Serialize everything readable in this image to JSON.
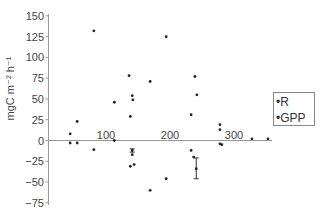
{
  "chart_data": {
    "type": "scatter",
    "title": "",
    "xlabel": "",
    "ylabel": "mgC m⁻² h⁻¹",
    "xlim": [
      0,
      380
    ],
    "ylim": [
      -75,
      150
    ],
    "x_ticks": [
      100,
      200,
      300
    ],
    "y_ticks": [
      150,
      125,
      100,
      75,
      50,
      25,
      0,
      -25,
      -50,
      -75
    ],
    "grid": false,
    "legend_position": "right",
    "legend": [
      "R",
      "GPP"
    ],
    "series": [
      {
        "name": "R",
        "points": [
          {
            "x": 44,
            "y": 8
          },
          {
            "x": 55,
            "y": 23
          },
          {
            "x": 44,
            "y": -3
          },
          {
            "x": 55,
            "y": -3
          },
          {
            "x": 81,
            "y": 132
          },
          {
            "x": 81,
            "y": -11
          },
          {
            "x": 113,
            "y": 46
          },
          {
            "x": 113,
            "y": 0
          },
          {
            "x": 136,
            "y": 78
          },
          {
            "x": 141,
            "y": 54
          },
          {
            "x": 142,
            "y": 49
          },
          {
            "x": 138,
            "y": 29
          },
          {
            "x": 169,
            "y": 71
          },
          {
            "x": 194,
            "y": 125
          },
          {
            "x": 233,
            "y": 31
          },
          {
            "x": 239,
            "y": 77
          },
          {
            "x": 242,
            "y": 55
          },
          {
            "x": 278,
            "y": 19
          },
          {
            "x": 278,
            "y": 13
          },
          {
            "x": 328,
            "y": 2
          },
          {
            "x": 353,
            "y": 2
          }
        ]
      },
      {
        "name": "GPP",
        "points": [
          {
            "x": 141,
            "y": -12,
            "err_low": -10,
            "err_high": -14
          },
          {
            "x": 141,
            "y": -17
          },
          {
            "x": 138,
            "y": -31
          },
          {
            "x": 144,
            "y": -29
          },
          {
            "x": 169,
            "y": -60
          },
          {
            "x": 194,
            "y": -46
          },
          {
            "x": 233,
            "y": -12
          },
          {
            "x": 237,
            "y": -20
          },
          {
            "x": 241,
            "y": -34,
            "err_low": -46,
            "err_high": -21
          },
          {
            "x": 278,
            "y": -4
          },
          {
            "x": 281,
            "y": -5
          }
        ]
      }
    ]
  },
  "axes": {
    "y_ticks": [
      "150",
      "125",
      "100",
      "75",
      "50",
      "25",
      "0",
      "−25",
      "−50",
      "−75"
    ],
    "x_ticks": [
      "100",
      "200",
      "300"
    ],
    "ylabel": "mgC m⁻² h⁻¹"
  },
  "legend": {
    "items": [
      "•R",
      "•GPP"
    ]
  }
}
